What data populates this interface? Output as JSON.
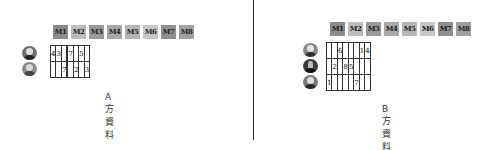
{
  "columns": [
    "M1",
    "M2",
    "M3",
    "M4",
    "M5",
    "M6",
    "M7",
    "M8"
  ],
  "tile_colors": [
    "#8a8a8a",
    "#bdbdbd",
    "#9a9a9a",
    "#a8a8a8",
    "#b5b5b5",
    "#c8c8c8",
    "#8f8f8f",
    "#a0a0a0"
  ],
  "party_a": {
    "caption": "A方資料",
    "rows": [
      {
        "avatar": "person-avatar-1",
        "cells": [
          "4",
          "3",
          "",
          "",
          "7",
          "",
          "5",
          ""
        ]
      },
      {
        "avatar": "person-avatar-2",
        "cells": [
          "",
          "",
          "7",
          "",
          "",
          "2",
          "",
          "3"
        ]
      }
    ]
  },
  "party_b": {
    "caption": "B方資料",
    "rows": [
      {
        "avatar": "person-avatar-3",
        "cells": [
          "",
          "",
          "6",
          "",
          "",
          "",
          "1",
          "4"
        ]
      },
      {
        "avatar": "person-avatar-4",
        "cells": [
          "",
          "2",
          "",
          "8",
          "5",
          "",
          "",
          ""
        ]
      },
      {
        "avatar": "person-avatar-5",
        "cells": [
          "1",
          "",
          "",
          "",
          "",
          "7",
          "",
          ""
        ]
      }
    ]
  }
}
